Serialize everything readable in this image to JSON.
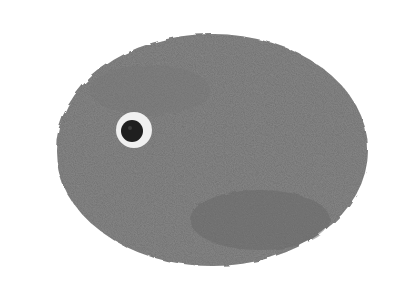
{
  "image": {
    "description": "Gray textured oval shape with a single eye, resembling a stylized fish or pebble creature on white background",
    "background_color": "#ffffff",
    "body_color": "#6e6e6e",
    "body_shadow_color": "#5f5f5f",
    "eye_ring_color": "#f2f2f2",
    "pupil_color": "#1e1e1e"
  }
}
